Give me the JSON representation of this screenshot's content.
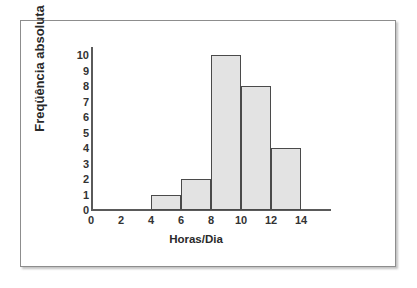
{
  "chart_data": {
    "type": "bar",
    "title": "",
    "subtitle": "",
    "xlabel": "Horas/Dia",
    "ylabel": "Freqüência absoluta",
    "bin_edges": [
      4,
      6,
      6,
      8,
      8,
      10,
      10,
      12,
      12,
      14
    ],
    "bins": [
      {
        "start": 4,
        "end": 6,
        "value": 1
      },
      {
        "start": 6,
        "end": 8,
        "value": 2
      },
      {
        "start": 8,
        "end": 10,
        "value": 10
      },
      {
        "start": 10,
        "end": 12,
        "value": 8
      },
      {
        "start": 12,
        "end": 14,
        "value": 4
      }
    ],
    "categories": [
      "4-6",
      "6-8",
      "8-10",
      "10-12",
      "12-14"
    ],
    "values": [
      1,
      2,
      10,
      8,
      4
    ],
    "xlim": [
      0,
      14
    ],
    "ylim": [
      0,
      10
    ],
    "x_ticks": [
      "0",
      "2",
      "4",
      "6",
      "8",
      "10",
      "12",
      "14"
    ],
    "y_ticks": [
      "0",
      "1",
      "2",
      "3",
      "4",
      "5",
      "6",
      "7",
      "8",
      "9",
      "10"
    ],
    "grid": false,
    "legend": null,
    "bar_fill_color": "#e3e3e3",
    "bar_border_color": "#4a4a4a",
    "axis_color": "#5a5a5a",
    "frame_border_color": "#8d8d8d"
  }
}
